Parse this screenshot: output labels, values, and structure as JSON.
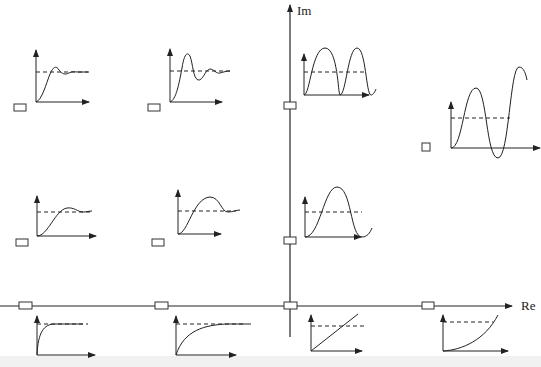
{
  "diagram": {
    "title": "",
    "axes": {
      "imag_label": "Im",
      "real_label": "Re"
    },
    "colors": {
      "line": "#222222",
      "dashed": "#333333",
      "background": "#ffffff"
    },
    "pole_markers": [
      {
        "id": "pole-top-left",
        "shape": "rect"
      },
      {
        "id": "pole-top-second",
        "shape": "rect"
      },
      {
        "id": "pole-top-imag-axis",
        "shape": "rect"
      },
      {
        "id": "pole-right-half",
        "shape": "square"
      },
      {
        "id": "pole-mid-left",
        "shape": "rect"
      },
      {
        "id": "pole-mid-second",
        "shape": "rect"
      },
      {
        "id": "pole-mid-imag-axis",
        "shape": "rect"
      },
      {
        "id": "pole-real-left-far",
        "shape": "rect"
      },
      {
        "id": "pole-real-left-near",
        "shape": "rect"
      },
      {
        "id": "pole-origin",
        "shape": "rect"
      },
      {
        "id": "pole-real-right",
        "shape": "rect"
      }
    ],
    "responses": [
      {
        "id": "resp-top-left",
        "type": "underdamped-light-overshoot"
      },
      {
        "id": "resp-top-second",
        "type": "underdamped-large-overshoot"
      },
      {
        "id": "resp-top-imag",
        "type": "sustained-oscillation"
      },
      {
        "id": "resp-right-half",
        "type": "growing-oscillation"
      },
      {
        "id": "resp-mid-left",
        "type": "underdamped-slow-small-overshoot"
      },
      {
        "id": "resp-mid-second",
        "type": "underdamped-slow-moderate-overshoot"
      },
      {
        "id": "resp-mid-imag",
        "type": "sustained-slow-oscillation"
      },
      {
        "id": "resp-real-left-far",
        "type": "fast-first-order"
      },
      {
        "id": "resp-real-left-near",
        "type": "slow-first-order"
      },
      {
        "id": "resp-origin",
        "type": "ramp"
      },
      {
        "id": "resp-real-right",
        "type": "exponential-growth"
      }
    ]
  }
}
